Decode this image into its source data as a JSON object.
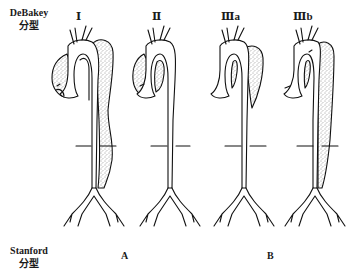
{
  "figure": {
    "row_labels": {
      "debakey": {
        "line1": "DeBakey",
        "line2": "分型"
      },
      "stanford": {
        "line1": "Stanford",
        "line2": "分型"
      }
    },
    "debakey_types": [
      {
        "label": "Ⅰ",
        "extent": "ascending + arch + descending + abdominal aorta"
      },
      {
        "label": "Ⅱ",
        "extent": "ascending aorta only"
      },
      {
        "label": "Ⅲa",
        "extent": "descending thoracic aorta"
      },
      {
        "label": "Ⅲb",
        "extent": "descending thoracic + abdominal aorta"
      }
    ],
    "stanford_types": [
      {
        "label": "A",
        "covers": [
          "Ⅰ",
          "Ⅱ"
        ]
      },
      {
        "label": "B",
        "covers": [
          "Ⅲa",
          "Ⅲb"
        ]
      }
    ],
    "colors": {
      "line": "#111111",
      "stipple": "#333333",
      "background": "#ffffff"
    }
  }
}
